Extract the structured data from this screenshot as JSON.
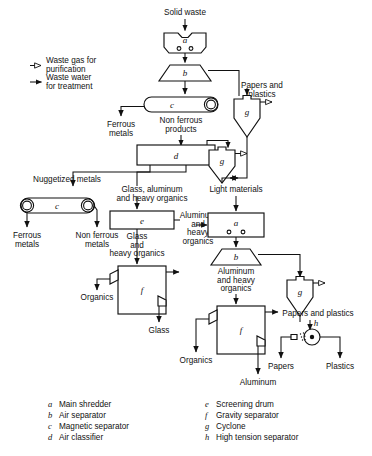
{
  "diagram": {
    "legend_arrows": [
      {
        "id": "waste-gas",
        "marker": "open-arrow",
        "line1": "Waste gas for",
        "line2": "purification"
      },
      {
        "id": "waste-water",
        "marker": "solid-arrow",
        "line1": "Waste water",
        "line2": "for treatment"
      }
    ],
    "units": [
      {
        "key": "a",
        "name": "Main shredder"
      },
      {
        "key": "b",
        "name": "Air separator"
      },
      {
        "key": "c",
        "name": "Magnetic separator"
      },
      {
        "key": "d",
        "name": "Air classifier"
      },
      {
        "key": "e",
        "name": "Screening drum"
      },
      {
        "key": "f",
        "name": "Gravity separator"
      },
      {
        "key": "g",
        "name": "Cyclone"
      },
      {
        "key": "h",
        "name": "High tension separator"
      }
    ],
    "unit_markers": {
      "shredder_top": "a",
      "air_separator_top": "b",
      "magnetic_top": "c",
      "air_classifier": "d",
      "cyclone_top_right": "g",
      "cyclone_mid": "g",
      "magnetic_left": "c",
      "screening_drum": "e",
      "gravity_left": "f",
      "shredder_right": "a",
      "air_separator_right": "b",
      "cyclone_bottom_right": "g",
      "gravity_right": "f",
      "high_tension": "h"
    },
    "stream_labels": [
      {
        "id": "solid-waste",
        "text": "Solid waste"
      },
      {
        "id": "papers-and-plastics-top",
        "line1": "Papers and",
        "line2": "plastics"
      },
      {
        "id": "ferrous-metals-top",
        "line1": "Ferrous",
        "line2": "metals"
      },
      {
        "id": "non-ferrous-products",
        "line1": "Non ferrous",
        "line2": "products"
      },
      {
        "id": "nuggetized-metals",
        "text": "Nuggetized metals"
      },
      {
        "id": "glass-aluminum-heavy-organics",
        "line1": "Glass, aluminum",
        "line2": "and heavy organics"
      },
      {
        "id": "light-materials",
        "text": "Light materials"
      },
      {
        "id": "ferrous-metals-left",
        "line1": "Ferrous",
        "line2": "metals"
      },
      {
        "id": "non-ferrous-metals-left",
        "line1": "Non ferrous",
        "line2": "metals"
      },
      {
        "id": "glass-and-heavy-organics",
        "line1": "Glass",
        "line2": "and",
        "line3": "heavy organics"
      },
      {
        "id": "aluminum-and-heavy-organics-right",
        "line1": "Aluminum",
        "line2": "and",
        "line3": "heavy",
        "line4": "organics"
      },
      {
        "id": "aluminum-and-heavy-organics-lower",
        "line1": "Aluminum",
        "line2": "and heavy",
        "line3": "organics"
      },
      {
        "id": "organics-left",
        "text": "Organics"
      },
      {
        "id": "glass-out",
        "text": "Glass"
      },
      {
        "id": "organics-right",
        "text": "Organics"
      },
      {
        "id": "aluminum-out",
        "text": "Aluminum"
      },
      {
        "id": "papers-and-plastics-bottom",
        "text": "Papers and  plastics"
      },
      {
        "id": "papers-out",
        "text": "Papers"
      },
      {
        "id": "plastics-out",
        "text": "Plastics"
      }
    ]
  }
}
